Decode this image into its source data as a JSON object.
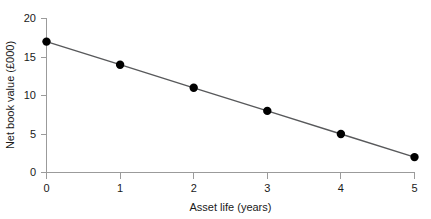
{
  "chart_data": {
    "type": "line",
    "title": "",
    "subtitle": "",
    "xlabel": "Asset life (years)",
    "ylabel": "Net book value (£000)",
    "x": [
      0,
      1,
      2,
      3,
      4,
      5
    ],
    "values": [
      17,
      14,
      11,
      8,
      5,
      2
    ],
    "series": [
      {
        "name": "Net book value",
        "values": [
          17,
          14,
          11,
          8,
          5,
          2
        ]
      }
    ],
    "xlim": [
      0,
      5
    ],
    "ylim": [
      0,
      20
    ],
    "xticks": [
      0,
      1,
      2,
      3,
      4,
      5
    ],
    "yticks": [
      0,
      5,
      10,
      15,
      20
    ],
    "xtick_labels": [
      "0",
      "1",
      "2",
      "3",
      "4",
      "5"
    ],
    "ytick_labels": [
      "0",
      "5",
      "10",
      "15",
      "20"
    ],
    "grid": false,
    "legend": false,
    "legend_position": "none",
    "marker": "circle",
    "line_color": "#58595b",
    "marker_color": "#000000",
    "axis_color": "#9b9b9b",
    "background_color": "#ffffff",
    "annotations": []
  },
  "axes": {
    "x_title": "Asset life (years)",
    "y_title": "Net book value (£000)"
  }
}
